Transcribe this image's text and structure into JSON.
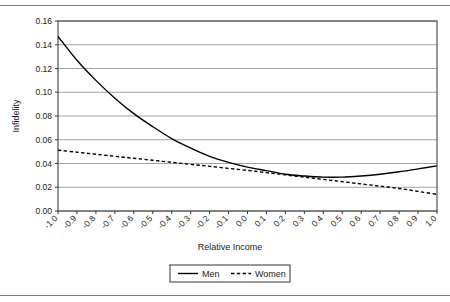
{
  "figure": {
    "has_top_rule": true,
    "has_bottom_rule": true,
    "background": "#ffffff"
  },
  "chart_data": {
    "type": "line",
    "title": "",
    "xlabel": "Relative Income",
    "ylabel": "Infidelity",
    "xlim": [
      -1.0,
      1.0
    ],
    "ylim": [
      0.0,
      0.16
    ],
    "grid": true,
    "grid_axis": "y",
    "legend_position": "bottom-center",
    "xticks": [
      "-1.0",
      "-0.9",
      "-0.8",
      "-0.7",
      "-0.6",
      "-0.5",
      "-0.4",
      "-0.3",
      "-0.2",
      "-0.1",
      "0.0",
      "0.1",
      "0.2",
      "0.3",
      "0.4",
      "0.5",
      "0.6",
      "0.7",
      "0.8",
      "0.9",
      "1.0"
    ],
    "xtick_rotation": 45,
    "yticks": [
      "0.00",
      "0.02",
      "0.04",
      "0.06",
      "0.08",
      "0.10",
      "0.12",
      "0.14",
      "0.16"
    ],
    "x": [
      -1.0,
      -0.9,
      -0.8,
      -0.7,
      -0.6,
      -0.5,
      -0.4,
      -0.3,
      -0.2,
      -0.1,
      0.0,
      0.1,
      0.2,
      0.3,
      0.4,
      0.5,
      0.6,
      0.7,
      0.8,
      0.9,
      1.0
    ],
    "series": [
      {
        "name": "Men",
        "style": "solid",
        "color": "#000000",
        "values": [
          0.147,
          0.127,
          0.11,
          0.095,
          0.082,
          0.071,
          0.061,
          0.053,
          0.046,
          0.041,
          0.037,
          0.034,
          0.031,
          0.0295,
          0.0285,
          0.0285,
          0.0295,
          0.031,
          0.033,
          0.0355,
          0.038
        ]
      },
      {
        "name": "Women",
        "style": "dashed",
        "color": "#000000",
        "values": [
          0.0512,
          0.0495,
          0.0478,
          0.0461,
          0.0444,
          0.0427,
          0.041,
          0.0393,
          0.0376,
          0.0359,
          0.0342,
          0.0323,
          0.0304,
          0.0285,
          0.0266,
          0.0247,
          0.0228,
          0.0209,
          0.019,
          0.0165,
          0.014
        ]
      }
    ]
  },
  "legend": {
    "entries": [
      {
        "label": "Men",
        "style": "solid"
      },
      {
        "label": "Women",
        "style": "dashed"
      }
    ]
  }
}
